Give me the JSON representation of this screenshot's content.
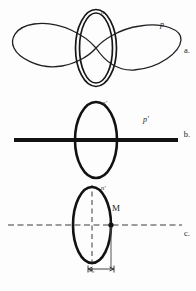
{
  "figure": {
    "title": "",
    "background_color": "#fdfdfd",
    "ink_color": "#1a1a1a",
    "width": 196,
    "height": 291,
    "panels": [
      {
        "id": "a",
        "marker": "a.",
        "description": "lemniscate (figure-eight) curve crossing a double-outlined vertical ellipse",
        "labels": [
          {
            "name": "n",
            "text": "n"
          },
          {
            "name": "p",
            "text": "p"
          }
        ],
        "shapes": {
          "ellipse": {
            "cx": 96,
            "cy": 48,
            "rx": 19,
            "ry": 38,
            "double_outline": true
          },
          "lemniscate": {
            "cx": 96,
            "cy": 48,
            "half_width": 82,
            "lobe_height": 26
          }
        }
      },
      {
        "id": "b",
        "marker": "b.",
        "description": "vertical ellipse intersected by a thick horizontal straight line",
        "labels": [
          {
            "name": "n-prime",
            "text": "n'"
          },
          {
            "name": "p-prime",
            "text": "p'"
          }
        ],
        "shapes": {
          "ellipse": {
            "cx": 96,
            "cy": 43,
            "rx": 21,
            "ry": 38,
            "double_outline": false
          },
          "axis_line": {
            "x1": 14,
            "x2": 178,
            "y": 43,
            "thickness": 4
          }
        }
      },
      {
        "id": "c",
        "marker": "c.",
        "description": "vertical ellipse with dashed horizontal and vertical axes, point M on the horizontal axis to the right of the ellipse, and a dimension x0 measured below",
        "labels": [
          {
            "name": "n-prime",
            "text": "n'"
          },
          {
            "name": "point-M",
            "text": "M"
          },
          {
            "name": "dimension-x0",
            "text": "x₀"
          }
        ],
        "shapes": {
          "ellipse": {
            "cx": 92,
            "cy": 40,
            "rx": 19,
            "ry": 38,
            "double_outline": false
          },
          "h_axis_dashed": {
            "x1": 8,
            "x2": 180,
            "y": 40
          },
          "v_axis_dashed": {
            "x": 92,
            "y1": 0,
            "y2": 84
          },
          "point_M": {
            "x": 111,
            "y": 40
          },
          "dimension": {
            "from_x": 92,
            "to_x": 111,
            "y": 85
          }
        }
      }
    ]
  }
}
